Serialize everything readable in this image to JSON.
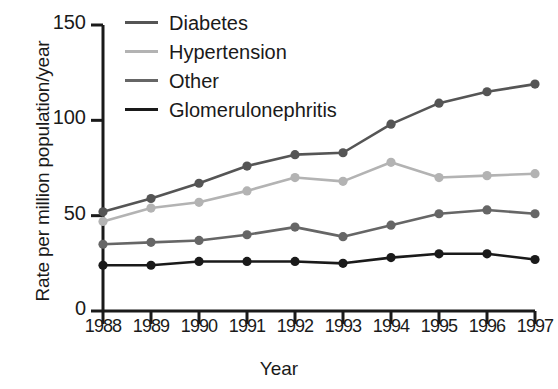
{
  "chart_data": {
    "type": "line",
    "title": "",
    "xlabel": "Year",
    "ylabel": "Rate per million population/year",
    "categories": [
      "1988",
      "1989",
      "1990",
      "1991",
      "1992",
      "1993",
      "1994",
      "1995",
      "1996",
      "1997"
    ],
    "x": [
      1988,
      1989,
      1990,
      1991,
      1992,
      1993,
      1994,
      1995,
      1996,
      1997
    ],
    "xlim": [
      1987.7,
      1997.3
    ],
    "ylim": [
      0,
      150
    ],
    "yticks": [
      0,
      50,
      100,
      150
    ],
    "ytick_labels": [
      "0",
      "50",
      "100",
      "150"
    ],
    "grid": false,
    "legend_position": "top-left inside",
    "markers": "filled circle",
    "series": [
      {
        "name": "Diabetes",
        "color": "#555555",
        "values": [
          52,
          59,
          67,
          76,
          82,
          83,
          98,
          109,
          115,
          119
        ]
      },
      {
        "name": "Hypertension",
        "color": "#b3b3b3",
        "values": [
          47,
          54,
          57,
          63,
          70,
          68,
          78,
          70,
          71,
          72
        ]
      },
      {
        "name": "Other",
        "color": "#666666",
        "values": [
          35,
          36,
          37,
          40,
          44,
          39,
          45,
          51,
          53,
          51
        ]
      },
      {
        "name": "Glomerulonephritis",
        "color": "#1a1a1a",
        "values": [
          24,
          24,
          26,
          26,
          26,
          25,
          28,
          30,
          30,
          27
        ]
      }
    ]
  },
  "legend": {
    "items": [
      {
        "label": "Diabetes",
        "color": "#555555"
      },
      {
        "label": "Hypertension",
        "color": "#b3b3b3"
      },
      {
        "label": "Other",
        "color": "#666666"
      },
      {
        "label": "Glomerulonephritis",
        "color": "#1a1a1a"
      }
    ]
  },
  "axes": {
    "y_title": "Rate per million population/year",
    "x_title": "Year",
    "y_tick_labels": [
      "150",
      "100",
      "50",
      "0"
    ],
    "x_tick_labels": [
      "1988",
      "1989",
      "1990",
      "1991",
      "1992",
      "1993",
      "1994",
      "1995",
      "1996",
      "1997"
    ]
  }
}
